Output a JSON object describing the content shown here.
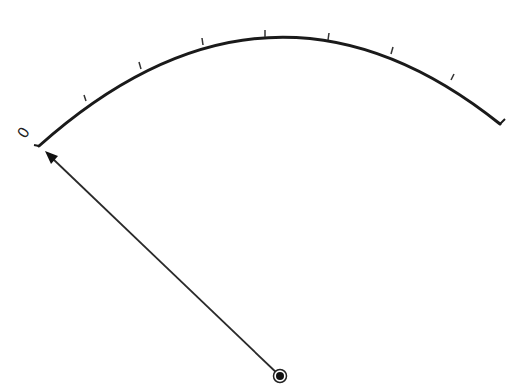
{
  "diagram": {
    "type": "gauge-dial",
    "scale": {
      "zero_label": "0",
      "arc_color": "#1a1a1a",
      "tick_count": 7
    },
    "needle": {
      "color": "#2a2a2a",
      "points_to": "0"
    },
    "pivot": {
      "color": "#111111"
    }
  }
}
